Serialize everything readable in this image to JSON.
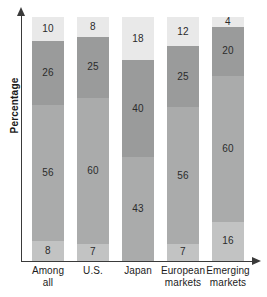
{
  "chart_data": {
    "type": "bar",
    "stacked": true,
    "orientation": "vertical",
    "title": "",
    "xlabel": "",
    "ylabel": "Percentage",
    "ylim": [
      0,
      100
    ],
    "grid": false,
    "legend": "none",
    "categories": [
      "Among all",
      "U.S.",
      "Japan",
      "European markets",
      "Emerging markets"
    ],
    "category_lines": [
      [
        "Among",
        "all"
      ],
      [
        "U.S.",
        ""
      ],
      [
        "Japan",
        ""
      ],
      [
        "European",
        "markets"
      ],
      [
        "Emerging",
        "markets"
      ]
    ],
    "series": [
      {
        "name": "segment-bottom",
        "color": "#c2c3c3",
        "values": [
          8,
          7,
          null,
          7,
          16
        ]
      },
      {
        "name": "segment-lower-middle",
        "color": "#aaabab",
        "values": [
          56,
          60,
          43,
          56,
          60
        ]
      },
      {
        "name": "segment-upper-middle",
        "color": "#9a9b9b",
        "values": [
          26,
          25,
          40,
          25,
          20
        ]
      },
      {
        "name": "segment-top",
        "color": "#e9e9e9",
        "values": [
          10,
          8,
          18,
          12,
          4
        ]
      }
    ],
    "bars": [
      {
        "category": "Among all",
        "segments": [
          {
            "label": "10",
            "value": 10,
            "color": "#e9e9e9"
          },
          {
            "label": "26",
            "value": 26,
            "color": "#9a9b9b"
          },
          {
            "label": "56",
            "value": 56,
            "color": "#aaabab"
          },
          {
            "label": "8",
            "value": 8,
            "color": "#c2c3c3"
          }
        ]
      },
      {
        "category": "U.S.",
        "segments": [
          {
            "label": "8",
            "value": 8,
            "color": "#e9e9e9"
          },
          {
            "label": "25",
            "value": 25,
            "color": "#9a9b9b"
          },
          {
            "label": "60",
            "value": 60,
            "color": "#aaabab"
          },
          {
            "label": "7",
            "value": 7,
            "color": "#c2c3c3"
          }
        ]
      },
      {
        "category": "Japan",
        "segments": [
          {
            "label": "18",
            "value": 18,
            "color": "#e9e9e9"
          },
          {
            "label": "40",
            "value": 40,
            "color": "#9a9b9b"
          },
          {
            "label": "43",
            "value": 43,
            "color": "#aaabab"
          }
        ]
      },
      {
        "category": "European markets",
        "segments": [
          {
            "label": "12",
            "value": 12,
            "color": "#e9e9e9"
          },
          {
            "label": "25",
            "value": 25,
            "color": "#9a9b9b"
          },
          {
            "label": "56",
            "value": 56,
            "color": "#aaabab"
          },
          {
            "label": "7",
            "value": 7,
            "color": "#c2c3c3"
          }
        ]
      },
      {
        "category": "Emerging markets",
        "segments": [
          {
            "label": "4",
            "value": 4,
            "color": "#e9e9e9"
          },
          {
            "label": "20",
            "value": 20,
            "color": "#9a9b9b"
          },
          {
            "label": "60",
            "value": 60,
            "color": "#aaabab"
          },
          {
            "label": "16",
            "value": 16,
            "color": "#c2c3c3"
          }
        ]
      }
    ]
  },
  "axes": {
    "y_arrow": "arrow-up-icon",
    "x_arrow": "arrow-right-icon"
  }
}
